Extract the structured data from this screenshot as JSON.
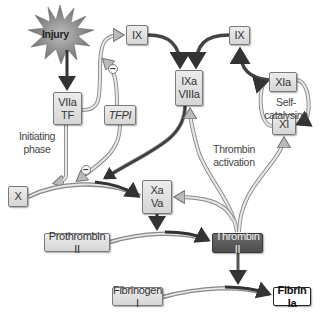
{
  "diagram": {
    "trigger": "Injury",
    "nodes": {
      "viia_tf": [
        "VIIa",
        "TF"
      ],
      "ix_left": "IX",
      "tfpi": "TFPI",
      "ixa_viiia": [
        "IXa",
        "VIIIa"
      ],
      "ix_right": "IX",
      "xia": "XIa",
      "xi": "XI",
      "x": "X",
      "xa_va": [
        "Xa",
        "Va"
      ],
      "prothrombin": "Prothrombin II",
      "thrombin": "Thrombin II",
      "fibrinogen": "Fibrinogen I",
      "fibrin": "Fibrin Ia"
    },
    "labels": {
      "initiating": [
        "Initiating",
        "phase"
      ],
      "thrombin_activation": [
        "Thrombin",
        "activation"
      ],
      "self_catalysing": "Self-catalysing"
    },
    "inhibition_symbol": "−",
    "colors": {
      "node_fill": "#dedede",
      "node_dark": "#575757",
      "arrow_dark": "#3a3a3a",
      "arrow_light": "#d0d0d0"
    }
  }
}
